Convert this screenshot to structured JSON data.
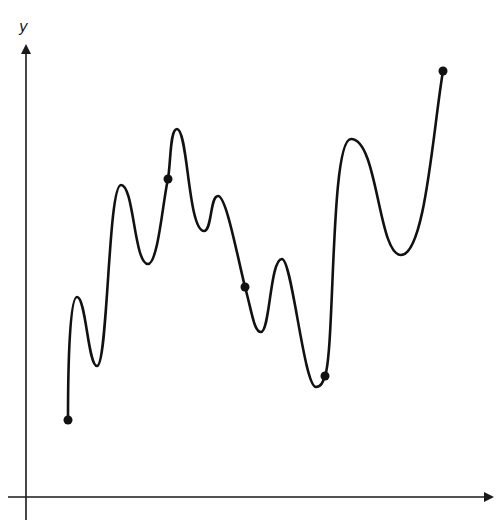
{
  "diagram": {
    "type": "function-graph",
    "axes": {
      "y_label": "y",
      "x_label": "",
      "color": "#1a1a1a"
    },
    "curve": {
      "color": "#111111",
      "description": "Wavy continuous curve with multiple local maxima and minima"
    },
    "marked_points": [
      {
        "id": "p1",
        "x": 68,
        "y": 420
      },
      {
        "id": "p2",
        "x": 168,
        "y": 179
      },
      {
        "id": "p3",
        "x": 245,
        "y": 287
      },
      {
        "id": "p4",
        "x": 325,
        "y": 376
      },
      {
        "id": "p5",
        "x": 443,
        "y": 71
      }
    ]
  }
}
